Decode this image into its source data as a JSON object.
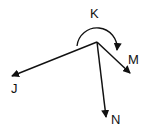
{
  "diagram": {
    "vertex": {
      "label": "K",
      "x": 97,
      "y": 42
    },
    "rays": [
      {
        "label": "J",
        "x": 12,
        "y": 76
      },
      {
        "label": "M",
        "x": 130,
        "y": 72
      },
      {
        "label": "N",
        "x": 106,
        "y": 116
      }
    ],
    "arc": {
      "from": "J",
      "to": "M",
      "direction": "clockwise",
      "type": "reflex"
    },
    "stroke_color": "#111111"
  }
}
